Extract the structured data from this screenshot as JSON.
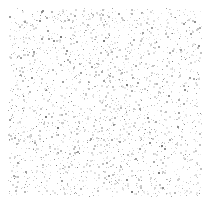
{
  "canvas": {
    "width": 214,
    "height": 210,
    "background_color": "#ffffff",
    "description": "Random speckle noise field on white background"
  },
  "noise_field": {
    "name": "speckle-noise-field",
    "x": 8,
    "y": 8,
    "width": 194,
    "height": 189,
    "margin_top": 8,
    "margin_left": 8,
    "margin_right": 12,
    "margin_bottom": 13,
    "density_per_1000px2": 62,
    "point_count": 2280,
    "dot_min_size": 1,
    "dot_max_size": 2,
    "distribution": "uniform",
    "seed": 20240517,
    "palette": [
      "#e9e9e9",
      "#e0e0e0",
      "#d6d6d6",
      "#cccccc",
      "#c2c2c2",
      "#b8b8b8",
      "#ababab",
      "#9e9e9e",
      "#8d8d8d",
      "#7a7a7a"
    ],
    "palette_weights": [
      18,
      17,
      15,
      13,
      11,
      9,
      7,
      5,
      3,
      2
    ]
  }
}
